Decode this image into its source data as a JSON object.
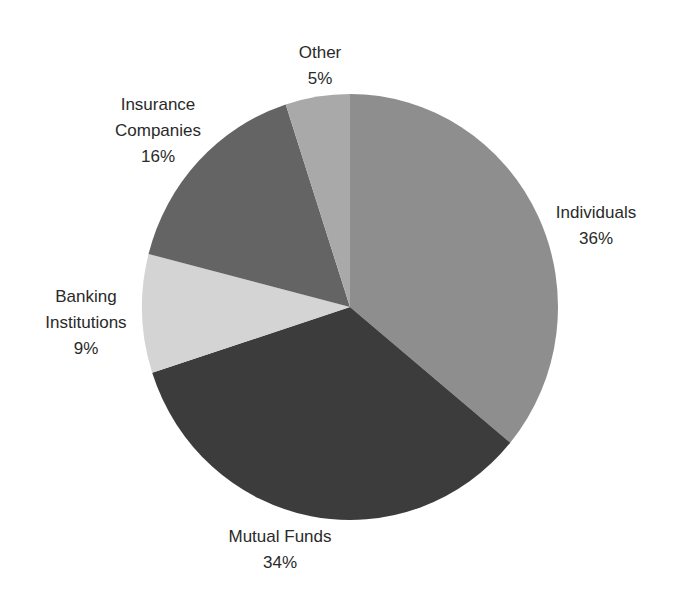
{
  "chart_data": {
    "type": "pie",
    "title": "",
    "categories": [
      "Individuals",
      "Mutual Funds",
      "Banking Institutions",
      "Insurance Companies",
      "Other"
    ],
    "values": [
      36,
      34,
      9,
      16,
      5
    ],
    "unit": "%",
    "start_angle_deg": 0,
    "direction": "clockwise",
    "colors": [
      "#8e8e8e",
      "#3c3c3c",
      "#d4d4d4",
      "#646464",
      "#a9a9a9"
    ],
    "legend": "none",
    "labels": [
      {
        "name": "Individuals",
        "value": "36%"
      },
      {
        "name": "Mutual Funds",
        "value": "34%"
      },
      {
        "name": "Banking Institutions",
        "value": "9%",
        "lines": [
          "Banking",
          "Institutions"
        ]
      },
      {
        "name": "Insurance Companies",
        "value": "16%",
        "lines": [
          "Insurance",
          "Companies"
        ]
      },
      {
        "name": "Other",
        "value": "5%"
      }
    ]
  },
  "labels": {
    "individuals": {
      "line1": "Individuals",
      "pct": "36%"
    },
    "mutual": {
      "line1": "Mutual Funds",
      "pct": "34%"
    },
    "banking": {
      "line1": "Banking",
      "line2": "Institutions",
      "pct": "9%"
    },
    "insurance": {
      "line1": "Insurance",
      "line2": "Companies",
      "pct": "16%"
    },
    "other": {
      "line1": "Other",
      "pct": "5%"
    }
  }
}
